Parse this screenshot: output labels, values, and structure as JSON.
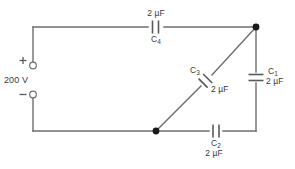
{
  "figure": {
    "kind": "capacitor-circuit-schematic",
    "source": {
      "value": "200 V",
      "plus_sign": "+",
      "minus_sign": "−"
    },
    "components": [
      {
        "id": "C4",
        "name": "C₄",
        "label_name": "C",
        "subscript": "4",
        "value": "2 µF",
        "orientation": "horizontal",
        "position": "top-branch",
        "value_position": "above",
        "name_position": "below"
      },
      {
        "id": "C1",
        "name": "C₁",
        "label_name": "C",
        "subscript": "1",
        "value": "2 µF",
        "orientation": "vertical",
        "position": "right-branch",
        "value_position": "right",
        "name_position": "right"
      },
      {
        "id": "C3",
        "name": "C₃",
        "label_name": "C",
        "subscript": "3",
        "value": "2 µF",
        "orientation": "diagonal",
        "position": "diagonal-branch",
        "value_position": "lower-right",
        "name_position": "upper-left"
      },
      {
        "id": "C2",
        "name": "C₂",
        "label_name": "C",
        "subscript": "2",
        "value": "2 µF",
        "orientation": "horizontal",
        "position": "bottom-branch",
        "value_position": "below",
        "name_position": "below"
      }
    ],
    "junctions": [
      {
        "id": "top-right-node",
        "x": 256,
        "y": 27
      },
      {
        "id": "bottom-mid-node",
        "x": 156,
        "y": 131
      }
    ],
    "colors": {
      "wire": "#6e6e6e",
      "plate": "#5a5a5a",
      "node": "#1a1a1a",
      "text": "#3a3a3a",
      "background": "#ffffff"
    }
  }
}
